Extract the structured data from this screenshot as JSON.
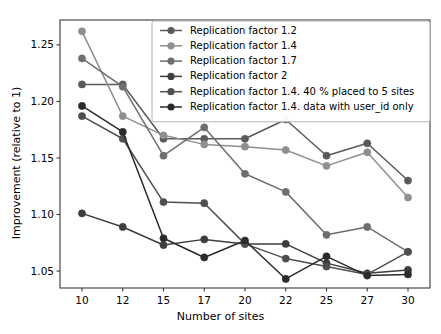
{
  "chart_data": {
    "type": "line",
    "title": "",
    "subtitle": "",
    "xlabel": "Number of sites",
    "ylabel": "Improvement (relative to 1)",
    "categories": [
      10,
      12,
      15,
      17,
      20,
      22,
      25,
      27,
      30
    ],
    "x_tick_labels": [
      "10",
      "12",
      "15",
      "17",
      "20",
      "22",
      "25",
      "27",
      "30"
    ],
    "y_tick_labels": [
      "1.05",
      "1.10",
      "1.15",
      "1.20",
      "1.25"
    ],
    "y_ticks": [
      1.05,
      1.1,
      1.15,
      1.2,
      1.25
    ],
    "ylim": [
      1.035,
      1.272
    ],
    "xlim": [
      9.0,
      31.0
    ],
    "grid": false,
    "legend_position": "upper center",
    "marker": "circle",
    "series": [
      {
        "name": "Replication factor 1.2",
        "color": "#5a5a5a",
        "values": [
          1.215,
          1.215,
          1.167,
          1.167,
          1.167,
          1.184,
          1.152,
          1.163,
          1.13
        ]
      },
      {
        "name": "Replication factor 1.4",
        "color": "#8f8f8f",
        "values": [
          1.262,
          1.187,
          1.17,
          1.162,
          1.16,
          1.157,
          1.143,
          1.155,
          1.115
        ]
      },
      {
        "name": "Replication factor 1.7",
        "color": "#6e6e6e",
        "values": [
          1.238,
          1.213,
          1.152,
          1.177,
          1.136,
          1.12,
          1.082,
          1.089,
          1.067
        ]
      },
      {
        "name": "Replication factor 2",
        "color": "#3d3d3d",
        "values": [
          1.101,
          1.089,
          1.073,
          1.078,
          1.074,
          1.074,
          1.057,
          1.048,
          1.051
        ]
      },
      {
        "name": "Replication factor 1.4. 40 % placed to 5 sites",
        "color": "#4f4f4f",
        "values": [
          1.187,
          1.167,
          1.111,
          1.11,
          1.074,
          1.061,
          1.054,
          1.047,
          1.067
        ]
      },
      {
        "name": "Replication factor 1.4. data with user_id only",
        "color": "#2b2b2b",
        "values": [
          1.196,
          1.173,
          1.079,
          1.062,
          1.077,
          1.043,
          1.063,
          1.046,
          1.047
        ]
      }
    ]
  },
  "legend": {
    "items": [
      "Replication factor 1.2",
      "Replication factor 1.4",
      "Replication factor 1.7",
      "Replication factor 2",
      "Replication factor 1.4. 40 % placed to 5 sites",
      "Replication factor 1.4. data with user_id only"
    ]
  },
  "axes": {
    "x_title": "Number of sites",
    "y_title": "Improvement (relative to 1)"
  }
}
